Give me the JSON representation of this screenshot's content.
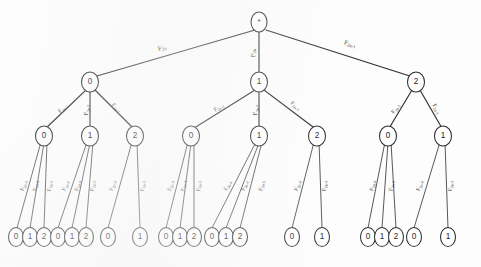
{
  "figure": {
    "type": "tree-diagram",
    "title": "",
    "background_color": "#fdfdfd",
    "stroke_color": "#2b2b2b"
  },
  "nodes": {
    "root": {
      "label": "*"
    },
    "level1": [
      {
        "label": "0"
      },
      {
        "label": "1"
      },
      {
        "label": "2"
      }
    ],
    "level2": [
      {
        "label": "0"
      },
      {
        "label": "1"
      },
      {
        "label": "2"
      },
      {
        "label": "0"
      },
      {
        "label": "1"
      },
      {
        "label": "2"
      },
      {
        "label": "0"
      },
      {
        "label": "1"
      }
    ],
    "level3": [
      {
        "label": "0"
      },
      {
        "label": "1"
      },
      {
        "label": "2"
      },
      {
        "label": "0"
      },
      {
        "label": "1"
      },
      {
        "label": "2"
      },
      {
        "label": "0"
      },
      {
        "label": "1"
      },
      {
        "label": "0"
      },
      {
        "label": "1"
      },
      {
        "label": "2"
      },
      {
        "label": "0"
      },
      {
        "label": "1"
      },
      {
        "label": "2"
      },
      {
        "label": "0"
      },
      {
        "label": "1"
      },
      {
        "label": "0"
      },
      {
        "label": "1"
      },
      {
        "label": "2"
      },
      {
        "label": "0"
      },
      {
        "label": "1"
      }
    ]
  },
  "edge_labels": {
    "root_to_level1": [
      {
        "base": "F",
        "sub": "2n"
      },
      {
        "base": "F",
        "sub": "2n"
      },
      {
        "base": "F",
        "sub": "2n-1"
      }
    ],
    "level1_to_level2": [
      {
        "base": "F",
        "sub": "2n-2"
      },
      {
        "base": "F",
        "sub": "2n-2"
      },
      {
        "base": "F",
        "sub": "2n-2"
      },
      {
        "base": "F",
        "sub": "2n-2"
      },
      {
        "base": "F",
        "sub": "2n-2"
      },
      {
        "base": "F",
        "sub": "2n-3"
      },
      {
        "base": "F",
        "sub": "2n-2"
      },
      {
        "base": "F",
        "sub": "2n-3"
      }
    ],
    "level2_to_level3": [
      {
        "base": "F",
        "sub": "2n-4"
      },
      {
        "base": "F",
        "sub": "2n-4"
      },
      {
        "base": "F",
        "sub": "2n-5"
      },
      {
        "base": "F",
        "sub": "2n-4"
      },
      {
        "base": "F",
        "sub": "2n-4"
      },
      {
        "base": "F",
        "sub": "2n-5"
      },
      {
        "base": "F",
        "sub": "2n-4"
      },
      {
        "base": "F",
        "sub": "2n-5"
      },
      {
        "base": "F",
        "sub": "2n-4"
      },
      {
        "base": "F",
        "sub": "2n-4"
      },
      {
        "base": "F",
        "sub": "2n-5"
      },
      {
        "base": "F",
        "sub": "2n-4"
      },
      {
        "base": "F",
        "sub": "2n-4"
      },
      {
        "base": "F",
        "sub": "2n-5"
      },
      {
        "base": "F",
        "sub": "2n-4"
      },
      {
        "base": "F",
        "sub": "2n-5"
      },
      {
        "base": "F",
        "sub": "2n-4"
      },
      {
        "base": "F",
        "sub": "2n-5"
      },
      {
        "base": "F",
        "sub": "2n-4"
      },
      {
        "base": "F",
        "sub": "2n-5"
      }
    ]
  }
}
